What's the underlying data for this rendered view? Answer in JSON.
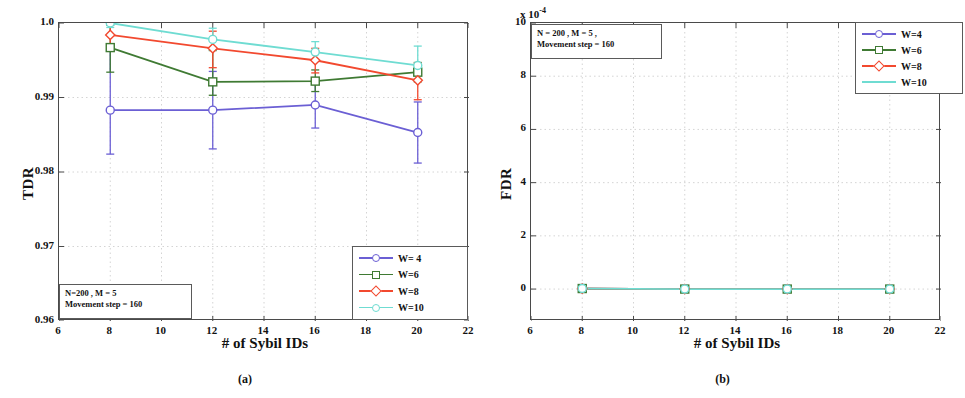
{
  "figure": {
    "captions": [
      {
        "label": "(a)"
      },
      {
        "label": "(b)"
      }
    ]
  },
  "panel_a": {
    "annotation_line1": "N=200 , M = 5",
    "annotation_line2": "Movement step = 160",
    "legend": [
      {
        "label": "W= 4",
        "color": "#6b5fd4"
      },
      {
        "label": "W=6",
        "color": "#3f7a33"
      },
      {
        "label": "W=8",
        "color": "#f2492f"
      },
      {
        "label": "W=10",
        "color": "#6fdcd2"
      }
    ]
  },
  "panel_b": {
    "annotation_line1": "N = 200 , M = 5 ,",
    "annotation_line2": "Movement step = 160",
    "exponent_label": "x 10",
    "exponent_power": "-4",
    "legend": [
      {
        "label": "W=4",
        "color": "#6b5fd4"
      },
      {
        "label": "W=6",
        "color": "#3f7a33"
      },
      {
        "label": "W=8",
        "color": "#f2492f"
      },
      {
        "label": "W=10",
        "color": "#6fdcd2"
      }
    ]
  },
  "chart_data": [
    {
      "type": "line",
      "panel": "(a)",
      "title": "",
      "xlabel": "# of Sybil IDs",
      "ylabel": "TDR",
      "xlim": [
        6,
        22
      ],
      "ylim": [
        0.96,
        1.0
      ],
      "xticks": [
        6,
        8,
        10,
        12,
        14,
        16,
        18,
        20,
        22
      ],
      "yticks": [
        0.96,
        0.97,
        0.98,
        0.99,
        1.0
      ],
      "ytick_labels": [
        "0.96",
        "0.97",
        "0.98",
        "0.99",
        "1.0"
      ],
      "grid": true,
      "legend_position": "lower right",
      "x": [
        8,
        12,
        16,
        20
      ],
      "series": [
        {
          "name": "W= 4",
          "color": "#6b5fd4",
          "marker": "circle",
          "values": [
            0.9883,
            0.9883,
            0.989,
            0.9853
          ],
          "err_low": [
            0.9824,
            0.9831,
            0.9859,
            0.9812
          ],
          "err_high": [
            0.9966,
            0.9935,
            0.9921,
            0.9894
          ]
        },
        {
          "name": "W=6",
          "color": "#3f7a33",
          "marker": "square",
          "values": [
            0.9967,
            0.9921,
            0.9922,
            0.9934
          ],
          "err_low": [
            0.9934,
            0.9903,
            0.9908,
            0.9921
          ],
          "err_high": [
            0.9997,
            0.9963,
            0.9937,
            0.9947
          ]
        },
        {
          "name": "W=8",
          "color": "#f2492f",
          "marker": "diamond",
          "values": [
            0.9984,
            0.9966,
            0.995,
            0.9923
          ],
          "err_low": [
            0.9966,
            0.994,
            0.9933,
            0.9897
          ],
          "err_high": [
            1.0003,
            0.9989,
            0.9966,
            0.9946
          ]
        },
        {
          "name": "W=10",
          "color": "#6fdcd2",
          "marker": "circle",
          "values": [
            1.0,
            0.9978,
            0.9961,
            0.9943
          ],
          "err_low": [
            0.9994,
            0.9964,
            0.9951,
            0.9933
          ],
          "err_high": [
            1.0006,
            0.9993,
            0.9975,
            0.9969
          ]
        }
      ]
    },
    {
      "type": "line",
      "panel": "(b)",
      "title": "",
      "xlabel": "# of Sybil IDs",
      "ylabel": "FDR",
      "y_multiplier": "x 10^-4",
      "xlim": [
        6,
        22
      ],
      "ylim": [
        -1.2,
        10
      ],
      "xticks": [
        6,
        8,
        10,
        12,
        14,
        16,
        18,
        20,
        22
      ],
      "yticks": [
        0,
        2,
        4,
        6,
        8,
        10
      ],
      "ytick_labels": [
        "0",
        "2",
        "4",
        "6",
        "8",
        "10"
      ],
      "grid": true,
      "legend_position": "upper right",
      "x": [
        8,
        12,
        16,
        20
      ],
      "series": [
        {
          "name": "W=4",
          "color": "#6b5fd4",
          "marker": "circle",
          "values": [
            0.02,
            0.0,
            0.0,
            0.0
          ]
        },
        {
          "name": "W=6",
          "color": "#3f7a33",
          "marker": "square",
          "values": [
            0.02,
            0.0,
            0.0,
            0.0
          ]
        },
        {
          "name": "W=8",
          "color": "#f2492f",
          "marker": "diamond",
          "values": [
            0.02,
            0.0,
            0.0,
            0.0
          ]
        },
        {
          "name": "W=10",
          "color": "#6fdcd2",
          "marker": "circle",
          "values": [
            0.02,
            0.0,
            0.0,
            0.0
          ]
        }
      ]
    }
  ]
}
